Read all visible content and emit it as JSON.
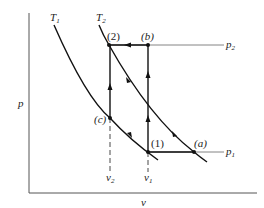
{
  "diagram": {
    "type": "p-v thermodynamic process diagram",
    "axes": {
      "ylabel": "p",
      "xlabel": "v"
    },
    "isotherms": [
      {
        "name": "T",
        "sub": "1",
        "passes_through": [
          "(c)",
          "(1)"
        ]
      },
      {
        "name": "T",
        "sub": "2",
        "passes_through": [
          "(2)",
          "(a)"
        ]
      }
    ],
    "pressure_lines": [
      {
        "name": "p",
        "sub": "2"
      },
      {
        "name": "p",
        "sub": "1"
      }
    ],
    "volume_marks": [
      {
        "name": "v",
        "sub": "2"
      },
      {
        "name": "v",
        "sub": "1"
      }
    ],
    "points": {
      "p2": "(2)",
      "pb": "(b)",
      "pc": "(c)",
      "p1": "(1)",
      "pa": "(a)"
    },
    "colors": {
      "line": "#111111",
      "thin_line": "#555555",
      "background": "#ffffff"
    }
  }
}
